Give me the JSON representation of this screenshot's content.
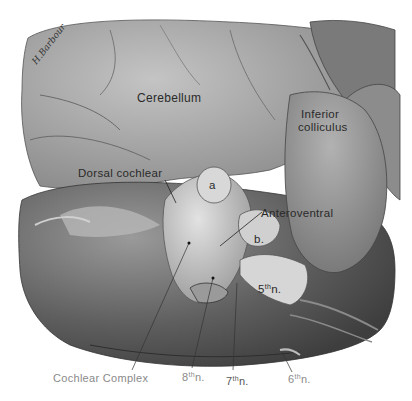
{
  "figure": {
    "signature": "H.Barbour",
    "labels": {
      "cerebellum": "Cerebellum",
      "inferior_colliculus_line1": "Inferior",
      "inferior_colliculus_line2": "colliculus",
      "dorsal_cochlear": "Dorsal cochlear",
      "anteroventral": "Anteroventral",
      "a": "a",
      "b": "b.",
      "fifth_nerve_num": "5",
      "fifth_nerve_sup": "th",
      "fifth_nerve_suffix": "n.",
      "cochlear_complex": "Cochlear Complex",
      "eighth_nerve_num": "8",
      "eighth_nerve_sup": "th",
      "eighth_nerve_suffix": "n.",
      "seventh_nerve_num": "7",
      "seventh_nerve_sup": "th",
      "seventh_nerve_suffix": "n.",
      "sixth_nerve_num": "6",
      "sixth_nerve_sup": "th",
      "sixth_nerve_suffix": "n."
    },
    "colors": {
      "background": "#ffffff",
      "cerebellum": "#a9a9a9",
      "brainstem": "#6e6e6e",
      "colliculus": "#9a9a9a",
      "cochlear": "#c8c8c8",
      "label_text": "#2a2a2a",
      "faint_label_text": "#8a8a8a"
    }
  }
}
